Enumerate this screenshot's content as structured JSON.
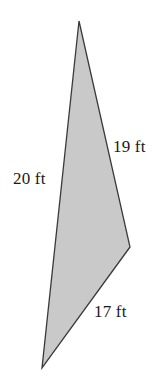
{
  "figure": {
    "name": "shaded-triangle-with-side-lengths",
    "background_color": "#ffffff",
    "fill_color": "#c9c9c9",
    "stroke_color": "#3a3a3a",
    "stroke_width": 1.3,
    "unit": "ft",
    "vertices": [
      {
        "name": "top",
        "x": 79,
        "y": 21
      },
      {
        "name": "right",
        "x": 130,
        "y": 247
      },
      {
        "name": "bottom-left",
        "x": 42,
        "y": 368
      }
    ],
    "polygon_points": "79,21 130,247 42,368",
    "labels": {
      "right_upper_side": "19 ft",
      "left_side": "20 ft",
      "bottom_right_side": "17 ft"
    },
    "sides": [
      {
        "label": "19 ft",
        "value": 19,
        "unit": "ft",
        "from": "top",
        "to": "right"
      },
      {
        "label": "17 ft",
        "value": 17,
        "unit": "ft",
        "from": "right",
        "to": "bottom-left"
      },
      {
        "label": "20 ft",
        "value": 20,
        "unit": "ft",
        "from": "bottom-left",
        "to": "top"
      }
    ]
  }
}
